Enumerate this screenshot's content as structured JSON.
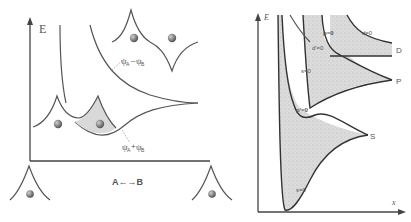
{
  "left_panel": {
    "y_axis_label": "E",
    "x_axis_label": "A←→B",
    "antibonding_label": {
      "main": "ψ",
      "sub_a": "A",
      "op": "–",
      "main2": "ψ",
      "sub_b": "B"
    },
    "bonding_label": {
      "main": "ψ",
      "sub_a": "A",
      "op": "+",
      "main2": "ψ",
      "sub_b": "B"
    },
    "atom_color": "#7a7a7a"
  },
  "right_panel": {
    "y_axis_label": "E",
    "x_axis_label": "x",
    "level_labels": [
      "D",
      "P",
      "S"
    ],
    "node_labels": [
      "d=0",
      "p=0",
      "d'=0",
      "s=0",
      "p'=0",
      "s=0"
    ],
    "shade_color": "#d9d9d9"
  }
}
